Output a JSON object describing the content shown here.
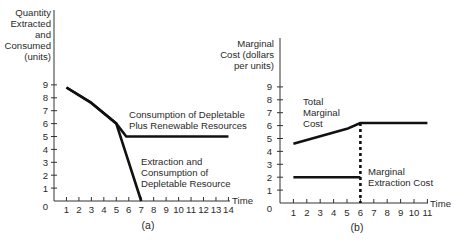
{
  "chart_data": [
    {
      "panel": "(a)",
      "type": "line",
      "title": "",
      "xlabel": "Time",
      "ylabel": "Quantity Extracted and Consumed (units)",
      "ylabel_lines": [
        "Quantity",
        "Extracted",
        "and",
        "Consumed",
        "(units)"
      ],
      "x_ticks": [
        1,
        2,
        3,
        4,
        5,
        6,
        7,
        8,
        9,
        10,
        11,
        12,
        13,
        14
      ],
      "y_ticks": [
        1,
        2,
        3,
        4,
        5,
        6,
        7,
        8,
        9
      ],
      "origin_label": "0",
      "xlim": [
        0,
        14.3
      ],
      "ylim": [
        0,
        9
      ],
      "grid": false,
      "series": [
        {
          "name": "Consumption of Depletable Plus Renewable Resources",
          "label_lines": [
            "Consumption of Depletable",
            "Plus Renewable Resources"
          ],
          "x": [
            1,
            3,
            5,
            5.8,
            14
          ],
          "y": [
            8.8,
            7.6,
            6.0,
            5.0,
            5.0
          ]
        },
        {
          "name": "Extraction and Consumption of Depletable Resource",
          "label_lines": [
            "Extraction and",
            "Consumption of",
            "Depletable Resource"
          ],
          "x": [
            1,
            3,
            5,
            7
          ],
          "y": [
            8.8,
            7.6,
            6.0,
            0
          ]
        }
      ]
    },
    {
      "panel": "(b)",
      "type": "line",
      "title": "",
      "xlabel": "Time",
      "ylabel": "Marginal Cost (dollars per units)",
      "ylabel_lines": [
        "Marginal",
        "Cost (dollars",
        "per units)"
      ],
      "x_ticks": [
        1,
        2,
        3,
        4,
        5,
        6,
        7,
        8,
        9,
        10,
        11
      ],
      "y_ticks": [
        1,
        2,
        3,
        4,
        5,
        6,
        7,
        8,
        9
      ],
      "origin_label": "0",
      "xlim": [
        0,
        11.2
      ],
      "ylim": [
        0,
        9
      ],
      "grid": false,
      "series": [
        {
          "name": "Total Marginal Cost",
          "label_lines": [
            "Total",
            "Marginal",
            "Cost"
          ],
          "x": [
            1,
            5,
            6,
            11
          ],
          "y": [
            4.6,
            5.75,
            6.2,
            6.2
          ]
        },
        {
          "name": "Marginal Extraction Cost",
          "label_lines": [
            "Marginal",
            "Extraction Cost"
          ],
          "x": [
            1,
            6
          ],
          "y": [
            2,
            2
          ]
        }
      ],
      "annotations": [
        {
          "type": "dotted-vertical-line",
          "x": 6,
          "y_from": 0,
          "y_to": 6.2
        }
      ]
    }
  ]
}
